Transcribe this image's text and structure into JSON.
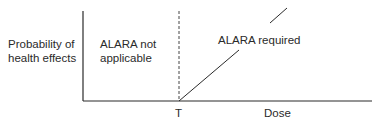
{
  "diagram": {
    "y_axis_label_line1": "Probability of",
    "y_axis_label_line2": "health effects",
    "x_axis_label": "Dose",
    "threshold_label": "T",
    "region_left_line1": "ALARA not",
    "region_left_line2": "applicable",
    "region_right": "ALARA required",
    "colors": {
      "line": "#2a2a2a",
      "background": "#ffffff"
    }
  }
}
